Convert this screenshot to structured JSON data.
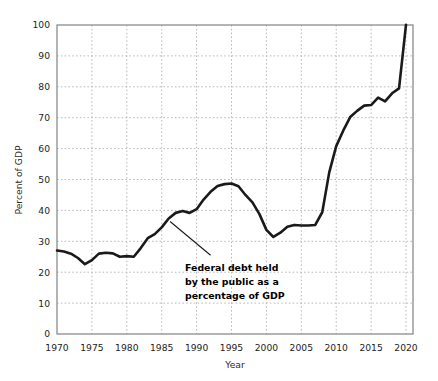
{
  "chart_data": {
    "type": "line",
    "title": "",
    "xlabel": "Year",
    "ylabel": "Percent of GDP",
    "xlim": [
      1970,
      2021
    ],
    "ylim": [
      0,
      100
    ],
    "grid": true,
    "legend_position": "none",
    "xticks": [
      "1970",
      "1975",
      "1980",
      "1985",
      "1990",
      "1995",
      "2000",
      "2005",
      "2010",
      "2015",
      "2020"
    ],
    "xtick_values": [
      1970,
      1975,
      1980,
      1985,
      1990,
      1995,
      2000,
      2005,
      2010,
      2015,
      2020
    ],
    "yticks": [
      "0",
      "10",
      "20",
      "30",
      "40",
      "50",
      "60",
      "70",
      "80",
      "90",
      "100"
    ],
    "ytick_values": [
      0,
      10,
      20,
      30,
      40,
      50,
      60,
      70,
      80,
      90,
      100
    ],
    "series": [
      {
        "name": "Federal debt held by the public as a percentage of GDP",
        "color": "#1a1a1a",
        "x": [
          1970,
          1971,
          1972,
          1973,
          1974,
          1975,
          1976,
          1977,
          1978,
          1979,
          1980,
          1981,
          1982,
          1983,
          1984,
          1985,
          1986,
          1987,
          1988,
          1989,
          1990,
          1991,
          1992,
          1993,
          1994,
          1995,
          1996,
          1997,
          1998,
          1999,
          2000,
          2001,
          2002,
          2003,
          2004,
          2005,
          2006,
          2007,
          2008,
          2009,
          2010,
          2011,
          2012,
          2013,
          2014,
          2015,
          2016,
          2017,
          2018,
          2019,
          2020
        ],
        "values": [
          27.0,
          26.7,
          26.0,
          24.6,
          22.6,
          23.9,
          26.0,
          26.3,
          26.1,
          25.0,
          25.2,
          25.0,
          27.8,
          31.0,
          32.3,
          34.5,
          37.4,
          39.2,
          39.8,
          39.2,
          40.4,
          43.5,
          46.0,
          47.9,
          48.5,
          48.7,
          47.8,
          45.0,
          42.6,
          38.8,
          33.7,
          31.4,
          32.8,
          34.7,
          35.3,
          35.1,
          35.1,
          35.3,
          39.4,
          52.3,
          60.8,
          65.8,
          70.2,
          72.2,
          73.9,
          74.1,
          76.5,
          75.3,
          77.9,
          79.5,
          100.1
        ]
      }
    ],
    "annotation": {
      "lines": [
        "Federal debt held",
        "by the public as a",
        "percentage of GDP"
      ],
      "pointer_from_x": 1986.2,
      "pointer_from_y": 36.4,
      "pointer_to_x": 1992.0,
      "pointer_to_y": 25.5
    }
  },
  "axes": {
    "ylabel": "Percent of GDP",
    "xlabel": "Year"
  }
}
